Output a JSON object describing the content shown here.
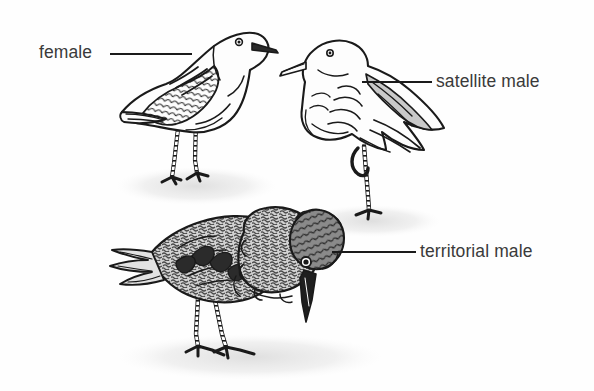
{
  "figure": {
    "background_color": "#fefefe",
    "ink_color": "#1a1a1a",
    "shadow_color": "#e8e8e8",
    "width": 594,
    "height": 391
  },
  "labels": {
    "female": "female",
    "satellite_male": "satellite male",
    "territorial_male": "territorial male"
  },
  "leader_lines": [
    {
      "name": "female",
      "x1": 110,
      "y1": 54,
      "x2": 192,
      "y2": 54
    },
    {
      "name": "satellite-male",
      "x1": 362,
      "y1": 82,
      "x2": 432,
      "y2": 82
    },
    {
      "name": "territorial-male",
      "x1": 332,
      "y1": 252,
      "x2": 416,
      "y2": 252
    }
  ],
  "birds": [
    {
      "id": "female",
      "label": "female",
      "posture": "standing upright on two legs, facing right",
      "plumage": "pale body with dark scalloped wing feathers",
      "bbox": [
        118,
        18,
        275,
        195
      ]
    },
    {
      "id": "satellite-male",
      "label": "satellite male",
      "posture": "standing on one leg, facing left, white ruff",
      "plumage": "white head and ruff, grey wing feathers",
      "bbox": [
        290,
        30,
        445,
        230
      ]
    },
    {
      "id": "territorial-male",
      "label": "territorial male",
      "posture": "crouched forward, head lowered, facing right",
      "plumage": "dark mottled ruff and head tuft, barred back",
      "bbox": [
        105,
        215,
        360,
        375
      ]
    }
  ],
  "shadows": [
    {
      "name": "female-shadow",
      "cx": 196,
      "cy": 186,
      "rx": 78,
      "ry": 18
    },
    {
      "name": "satellite-shadow",
      "cx": 372,
      "cy": 222,
      "rx": 66,
      "ry": 15
    },
    {
      "name": "territorial-shadow",
      "cx": 248,
      "cy": 358,
      "rx": 130,
      "ry": 22
    }
  ]
}
